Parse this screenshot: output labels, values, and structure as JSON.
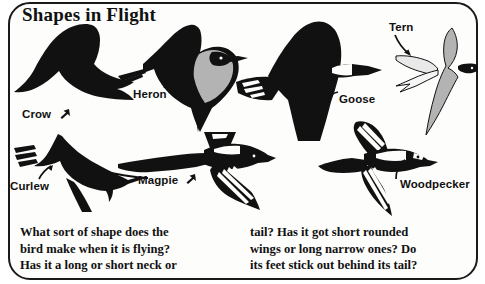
{
  "page": {
    "title": "Shapes in Flight",
    "width": 485,
    "height": 284,
    "background_color": "#ffffff",
    "ink_color": "#111111",
    "accent_gray": "#b3b3b3"
  },
  "birds": [
    {
      "name": "Crow",
      "label": "Crow",
      "fill": "#111111",
      "pointer": "arrow-up-right",
      "label_x": 22,
      "label_y": 108
    },
    {
      "name": "Heron",
      "label": "Heron",
      "fill": "#111111",
      "accent_fill": "#b3b3b3",
      "pointer": "arrow-up-right",
      "label_x": 133,
      "label_y": 88
    },
    {
      "name": "Goose",
      "label": "Goose",
      "fill": "#111111",
      "pointer": "arrow-left-curve",
      "label_x": 339,
      "label_y": 93
    },
    {
      "name": "Tern",
      "label": "Tern",
      "fill": "#b3b3b3",
      "accent_fill": "#111111",
      "pointer": "arrow-down-right",
      "label_x": 389,
      "label_y": 21
    },
    {
      "name": "Curlew",
      "label": "Curlew",
      "fill": "#111111",
      "pointer": "arrow-up-right",
      "label_x": 10,
      "label_y": 180
    },
    {
      "name": "Magpie",
      "label": "Magpie",
      "fill": "#111111",
      "pointer": "arrow-up-right",
      "label_x": 138,
      "label_y": 174
    },
    {
      "name": "Woodpecker",
      "label": "Woodpecker",
      "fill": "#111111",
      "pointer": "arrow-up-right",
      "label_x": 400,
      "label_y": 178
    }
  ],
  "caption": {
    "column_left": "What sort of shape does the\nbird make when it is flying?\nHas it a long or short neck or",
    "column_right": "tail? Has it got short rounded\nwings or long narrow ones? Do\nits feet stick out behind its tail?"
  }
}
